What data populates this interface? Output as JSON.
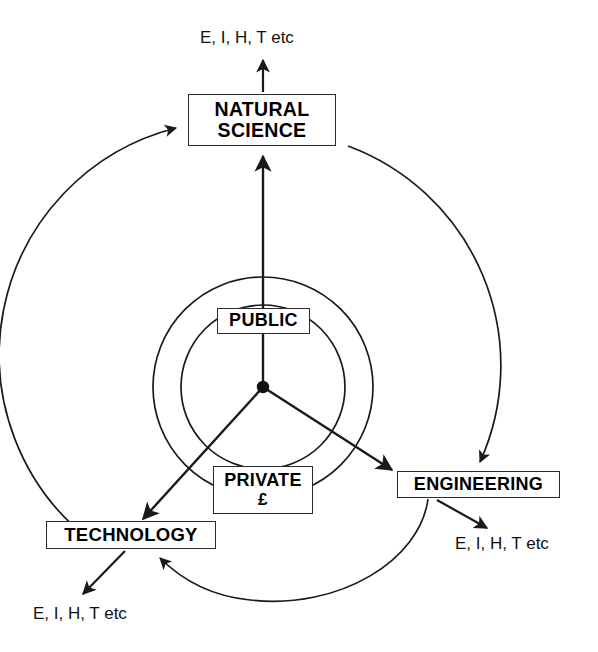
{
  "diagram": {
    "hub": {
      "label": "hub-origin"
    },
    "nodes": {
      "natural_science": "NATURAL\nSCIENCE",
      "public": "PUBLIC",
      "private_line1": "PRIVATE",
      "private_line2": "£",
      "engineering": "ENGINEERING",
      "technology": "TECHNOLOGY"
    },
    "outcomes": {
      "top": "E, I, H, T etc",
      "right": "E, I, H, T etc",
      "bottom": "E, I, H, T etc"
    },
    "rings": [
      {
        "name": "inner-ring-public",
        "radius": 82
      },
      {
        "name": "middle-ring-private",
        "radius": 110
      },
      {
        "name": "outer-ring-feedback",
        "radius": 234
      }
    ],
    "colors": {
      "stroke": "#1a1a1a",
      "box_border": "#2b2b2b",
      "background": "#ffffff",
      "text": "#000000"
    }
  }
}
